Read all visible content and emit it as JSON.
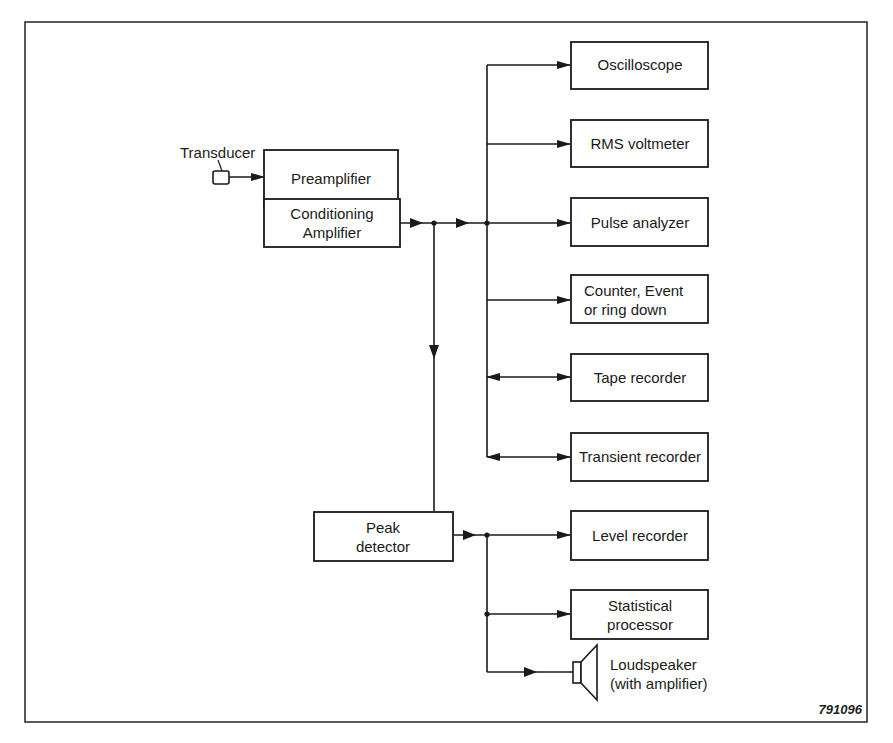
{
  "figure": {
    "id_label": "791096",
    "frame_color": "#222222",
    "line_color": "#1a1a1a"
  },
  "labels": {
    "transducer": "Transducer"
  },
  "blocks": {
    "preamplifier": {
      "lines": [
        "Preamplifier"
      ]
    },
    "conditioning_amplifier": {
      "lines": [
        "Conditioning",
        "Amplifier"
      ]
    },
    "peak_detector": {
      "lines": [
        "Peak",
        "detector"
      ]
    },
    "oscilloscope": {
      "lines": [
        "Oscilloscope"
      ]
    },
    "rms_voltmeter": {
      "lines": [
        "RMS voltmeter"
      ]
    },
    "pulse_analyzer": {
      "lines": [
        "Pulse analyzer"
      ]
    },
    "counter": {
      "lines": [
        "Counter, Event",
        "or ring down"
      ]
    },
    "tape_recorder": {
      "lines": [
        "Tape recorder"
      ]
    },
    "transient_recorder": {
      "lines": [
        "Transient recorder"
      ]
    },
    "level_recorder": {
      "lines": [
        "Level recorder"
      ]
    },
    "statistical_processor": {
      "lines": [
        "Statistical",
        "processor"
      ]
    }
  },
  "loudspeaker": {
    "lines": [
      "Loudspeaker",
      "(with amplifier)"
    ]
  },
  "connections": [
    {
      "from": "Transducer",
      "to": "Preamplifier"
    },
    {
      "from": "Preamplifier",
      "to": "Conditioning Amplifier"
    },
    {
      "from": "Conditioning Amplifier",
      "to": "Oscilloscope"
    },
    {
      "from": "Conditioning Amplifier",
      "to": "RMS voltmeter"
    },
    {
      "from": "Conditioning Amplifier",
      "to": "Pulse analyzer"
    },
    {
      "from": "Conditioning Amplifier",
      "to": "Counter, Event or ring down"
    },
    {
      "from": "Conditioning Amplifier",
      "to": "Tape recorder",
      "bidirectional": true
    },
    {
      "from": "Conditioning Amplifier",
      "to": "Transient recorder",
      "bidirectional": true
    },
    {
      "from": "Conditioning Amplifier",
      "to": "Peak detector"
    },
    {
      "from": "Peak detector",
      "to": "Level recorder"
    },
    {
      "from": "Peak detector",
      "to": "Statistical processor"
    },
    {
      "from": "Peak detector",
      "to": "Loudspeaker (with amplifier)"
    }
  ]
}
